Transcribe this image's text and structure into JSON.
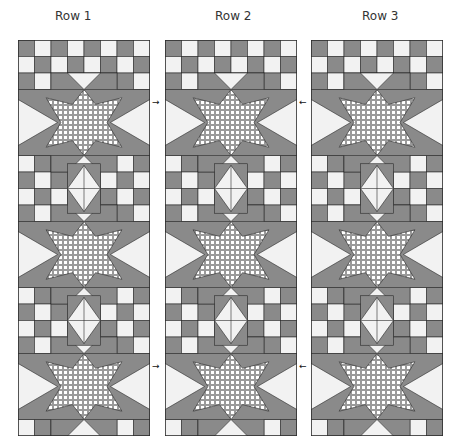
{
  "labels": [
    "Row 1",
    "Row 2",
    "Row 3"
  ],
  "colors": {
    "dark": "#8a8a8a",
    "light": "#f2f2f2",
    "line": "#2a2a2a",
    "gingham_bg": "#9a9a9a",
    "gingham_dot": "#ffffff"
  },
  "arrows": {
    "right": "→",
    "left": "←"
  },
  "grid": {
    "cols": 8,
    "rows": 24,
    "cell": 16.5
  }
}
